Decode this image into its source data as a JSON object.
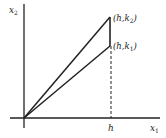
{
  "diagram": {
    "y_axis_label": "x",
    "y_axis_sub": "2",
    "x_axis_label": "x",
    "x_axis_sub": "1",
    "h_label": "h",
    "point_top": {
      "prefix": "(h,k",
      "sub": "2",
      "suffix": ")"
    },
    "point_bottom": {
      "prefix": "(h,k",
      "sub": "1",
      "suffix": ")"
    },
    "colors": {
      "stroke": "#222222",
      "background": "#ffffff"
    }
  }
}
